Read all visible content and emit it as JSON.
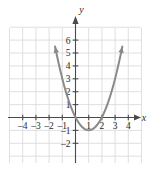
{
  "chart_data": {
    "type": "line",
    "title": "",
    "subtitle": "",
    "xlabel": "x",
    "ylabel": "y",
    "xlim": [
      -4.9,
      4.9
    ],
    "ylim": [
      -2.6,
      7.6
    ],
    "grid": true,
    "legend": null,
    "x_ticks": [
      -4,
      -3,
      -2,
      -1,
      1,
      2,
      3,
      4
    ],
    "x_tick_labels": [
      "–4",
      "–3",
      "–2",
      "–1",
      "1",
      "2",
      "3",
      "4"
    ],
    "y_ticks": [
      -2,
      -1,
      1,
      2,
      3,
      4,
      5,
      6
    ],
    "y_tick_labels": [
      "–2",
      "–1",
      "1",
      "2",
      "3",
      "4",
      "5",
      "6"
    ],
    "series": [
      {
        "name": "parabola",
        "equation": "y = x^2 - 2x",
        "vertex": [
          1,
          -1
        ],
        "x_intercepts": [
          0,
          2
        ],
        "y_intercept": 0,
        "color": "#8a8a8a",
        "arrow_start": true,
        "arrow_end": true,
        "points": [
          {
            "x": -1.55,
            "y": 5.5
          },
          {
            "x": -1.4,
            "y": 4.76
          },
          {
            "x": -1.2,
            "y": 3.84
          },
          {
            "x": -1.0,
            "y": 3.0
          },
          {
            "x": -0.8,
            "y": 2.24
          },
          {
            "x": -0.6,
            "y": 1.56
          },
          {
            "x": -0.4,
            "y": 0.96
          },
          {
            "x": -0.2,
            "y": 0.44
          },
          {
            "x": 0.0,
            "y": 0.0
          },
          {
            "x": 0.2,
            "y": -0.36
          },
          {
            "x": 0.4,
            "y": -0.64
          },
          {
            "x": 0.6,
            "y": -0.84
          },
          {
            "x": 0.8,
            "y": -0.96
          },
          {
            "x": 1.0,
            "y": -1.0
          },
          {
            "x": 1.2,
            "y": -0.96
          },
          {
            "x": 1.4,
            "y": -0.84
          },
          {
            "x": 1.6,
            "y": -0.64
          },
          {
            "x": 1.8,
            "y": -0.36
          },
          {
            "x": 2.0,
            "y": 0.0
          },
          {
            "x": 2.2,
            "y": 0.44
          },
          {
            "x": 2.4,
            "y": 0.96
          },
          {
            "x": 2.6,
            "y": 1.56
          },
          {
            "x": 2.8,
            "y": 2.24
          },
          {
            "x": 3.0,
            "y": 3.0
          },
          {
            "x": 3.2,
            "y": 3.84
          },
          {
            "x": 3.4,
            "y": 4.76
          },
          {
            "x": 3.55,
            "y": 5.5
          }
        ]
      }
    ],
    "colors": {
      "curve": "#8a8a8a",
      "axis": "#4a4a4a",
      "grid": "#d8d8d8",
      "text": "#2b2b2b",
      "background": "#ffffff"
    }
  },
  "axis_labels": {
    "x": "x",
    "y": "y"
  }
}
